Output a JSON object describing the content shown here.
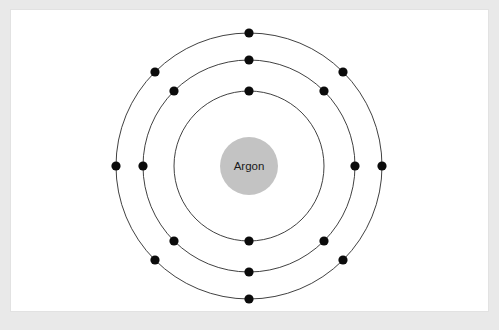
{
  "figure": {
    "kind": "bohr-model-diagram",
    "element_name": "Argon",
    "nucleus_label": "Argon",
    "total_electrons": 18,
    "background_color": "#e9e9e9",
    "panel_color": "#ffffff",
    "panel_border_color": "#e2e2e2",
    "orbit_color": "#2b2b2b",
    "electron_color": "#0b0b0b",
    "nucleus_color": "#c3c3c3",
    "nucleus_text_color": "#1a1a1a"
  },
  "chart_data": {
    "type": "scatter",
    "title": "Argon",
    "subtitle": "",
    "xlabel": "",
    "ylabel": "",
    "grid": false,
    "legend": "none",
    "center": {
      "x": 249,
      "y": 166
    },
    "nucleus": {
      "label": "Argon",
      "radius": 29,
      "color": "#c3c3c3"
    },
    "electron_dot_radius": 4.6,
    "shells": [
      {
        "name": "K",
        "index": 1,
        "radius": 75,
        "electron_count": 2,
        "electron_angles_deg": [
          0,
          180
        ],
        "electrons": [
          {
            "x": 249,
            "y": 91
          },
          {
            "x": 249,
            "y": 241
          }
        ]
      },
      {
        "name": "L",
        "index": 2,
        "radius": 106,
        "electron_count": 8,
        "electron_angles_deg": [
          0,
          45,
          90,
          135,
          180,
          225,
          270,
          315
        ],
        "electrons": [
          {
            "x": 249,
            "y": 60
          },
          {
            "x": 324,
            "y": 91
          },
          {
            "x": 355,
            "y": 166
          },
          {
            "x": 324,
            "y": 241
          },
          {
            "x": 249,
            "y": 272
          },
          {
            "x": 174,
            "y": 241
          },
          {
            "x": 143,
            "y": 166
          },
          {
            "x": 174,
            "y": 91
          }
        ]
      },
      {
        "name": "M",
        "index": 3,
        "radius": 133,
        "electron_count": 8,
        "electron_angles_deg": [
          0,
          45,
          90,
          135,
          180,
          225,
          270,
          315
        ],
        "electrons": [
          {
            "x": 249,
            "y": 33
          },
          {
            "x": 343,
            "y": 72
          },
          {
            "x": 382,
            "y": 166
          },
          {
            "x": 343,
            "y": 260
          },
          {
            "x": 249,
            "y": 299
          },
          {
            "x": 155,
            "y": 260
          },
          {
            "x": 116,
            "y": 166
          },
          {
            "x": 155,
            "y": 72
          }
        ]
      }
    ],
    "electron_configuration": "2, 8, 8",
    "atomic_number": 18
  }
}
